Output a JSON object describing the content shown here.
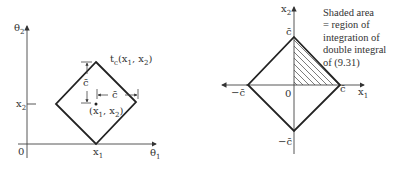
{
  "left_diagram": {
    "y_axis_label": "θ",
    "y_axis_sub": "2",
    "x_axis_label": "θ",
    "x_axis_sub": "1",
    "origin_label": "0",
    "x2_tick_label": "x",
    "x2_tick_sub": "2",
    "x1_tick_label": "x",
    "x1_tick_sub": "1",
    "region_label": "t",
    "region_label_sub": "c",
    "region_label_args": "(x",
    "region_label_args_sub1": "1",
    "region_label_args_mid": ", x",
    "region_label_args_sub2": "2",
    "region_label_args_end": ")",
    "point_label": "(x",
    "point_label_sub1": "1",
    "point_label_mid": ", x",
    "point_label_sub2": "2",
    "point_label_end": ")",
    "vertical_dim_label": "c̄",
    "horizontal_dim_label": "c̄"
  },
  "right_diagram": {
    "y_axis_label": "x",
    "y_axis_sub": "2",
    "x_axis_label": "x",
    "x_axis_sub": "1",
    "origin_label": "0",
    "top_label": "c̄",
    "bottom_label": "−c̄",
    "left_label": "−c̄",
    "right_label": "c̄",
    "note_lines": [
      "Shaded area",
      "= region of",
      "integration of",
      "double integral",
      "of (9.31)"
    ]
  }
}
